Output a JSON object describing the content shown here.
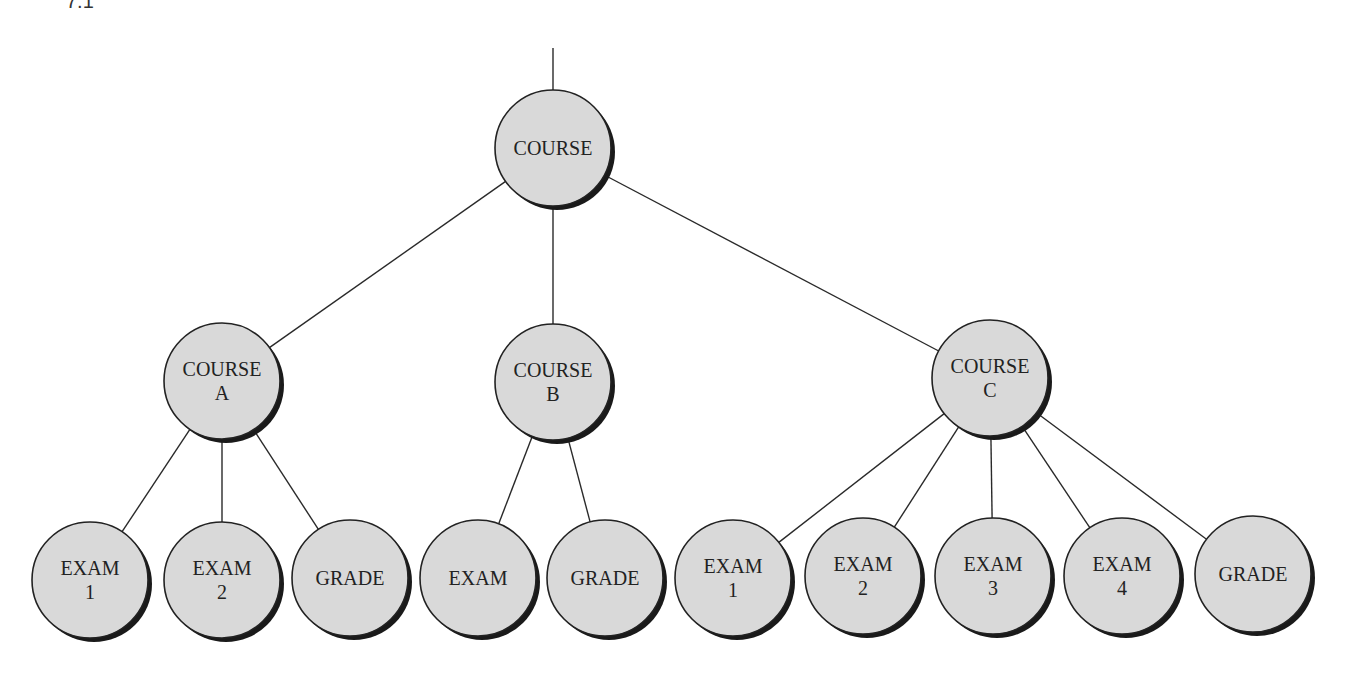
{
  "figure_label": "7.1",
  "colors": {
    "node_fill": "#d9d9d9",
    "node_stroke": "#222222",
    "edge": "#2a2a2a",
    "shadow": "#1a1a1a"
  },
  "root_edge": {
    "x": 553,
    "y1": 48,
    "y2": 90
  },
  "nodes": [
    {
      "id": "root",
      "lines": [
        "COURSE"
      ],
      "cx": 553,
      "cy": 148,
      "r": 58
    },
    {
      "id": "course-a",
      "lines": [
        "COURSE",
        "A"
      ],
      "cx": 222,
      "cy": 381,
      "r": 58
    },
    {
      "id": "course-b",
      "lines": [
        "COURSE",
        "B"
      ],
      "cx": 553,
      "cy": 382,
      "r": 58
    },
    {
      "id": "course-c",
      "lines": [
        "COURSE",
        "C"
      ],
      "cx": 990,
      "cy": 378,
      "r": 58
    },
    {
      "id": "a-exam-1",
      "lines": [
        "EXAM",
        "1"
      ],
      "cx": 90,
      "cy": 580,
      "r": 58
    },
    {
      "id": "a-exam-2",
      "lines": [
        "EXAM",
        "2"
      ],
      "cx": 222,
      "cy": 580,
      "r": 58
    },
    {
      "id": "a-grade",
      "lines": [
        "GRADE"
      ],
      "cx": 350,
      "cy": 578,
      "r": 58
    },
    {
      "id": "b-exam",
      "lines": [
        "EXAM"
      ],
      "cx": 478,
      "cy": 578,
      "r": 58
    },
    {
      "id": "b-grade",
      "lines": [
        "GRADE"
      ],
      "cx": 605,
      "cy": 578,
      "r": 58
    },
    {
      "id": "c-exam-1",
      "lines": [
        "EXAM",
        "1"
      ],
      "cx": 733,
      "cy": 578,
      "r": 58
    },
    {
      "id": "c-exam-2",
      "lines": [
        "EXAM",
        "2"
      ],
      "cx": 863,
      "cy": 576,
      "r": 58
    },
    {
      "id": "c-exam-3",
      "lines": [
        "EXAM",
        "3"
      ],
      "cx": 993,
      "cy": 576,
      "r": 58
    },
    {
      "id": "c-exam-4",
      "lines": [
        "EXAM",
        "4"
      ],
      "cx": 1122,
      "cy": 576,
      "r": 58
    },
    {
      "id": "c-grade",
      "lines": [
        "GRADE"
      ],
      "cx": 1253,
      "cy": 574,
      "r": 58
    }
  ],
  "edges": [
    [
      "root",
      "course-a"
    ],
    [
      "root",
      "course-b"
    ],
    [
      "root",
      "course-c"
    ],
    [
      "course-a",
      "a-exam-1"
    ],
    [
      "course-a",
      "a-exam-2"
    ],
    [
      "course-a",
      "a-grade"
    ],
    [
      "course-b",
      "b-exam"
    ],
    [
      "course-b",
      "b-grade"
    ],
    [
      "course-c",
      "c-exam-1"
    ],
    [
      "course-c",
      "c-exam-2"
    ],
    [
      "course-c",
      "c-exam-3"
    ],
    [
      "course-c",
      "c-exam-4"
    ],
    [
      "course-c",
      "c-grade"
    ]
  ]
}
